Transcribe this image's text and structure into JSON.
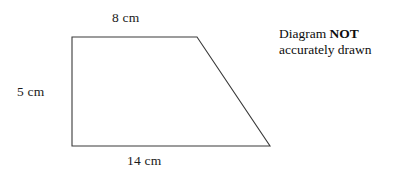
{
  "figure": {
    "name": "trapezium-diagram",
    "shape_type": "trapezium",
    "stroke_color": "#3a3a3a",
    "fill_color": "#ffffff",
    "background_color": "#ffffff",
    "vertices": [
      {
        "name": "top-left",
        "x": 72,
        "y": 37
      },
      {
        "name": "top-right",
        "x": 197,
        "y": 37
      },
      {
        "name": "bottom-right",
        "x": 270,
        "y": 146
      },
      {
        "name": "bottom-left",
        "x": 72,
        "y": 146
      }
    ]
  },
  "labels": {
    "top": "8 cm",
    "left": "5 cm",
    "bottom": "14 cm"
  },
  "note": {
    "line1_prefix": "Diagram ",
    "line1_emphasis": "NOT",
    "line2": "accurately drawn"
  }
}
